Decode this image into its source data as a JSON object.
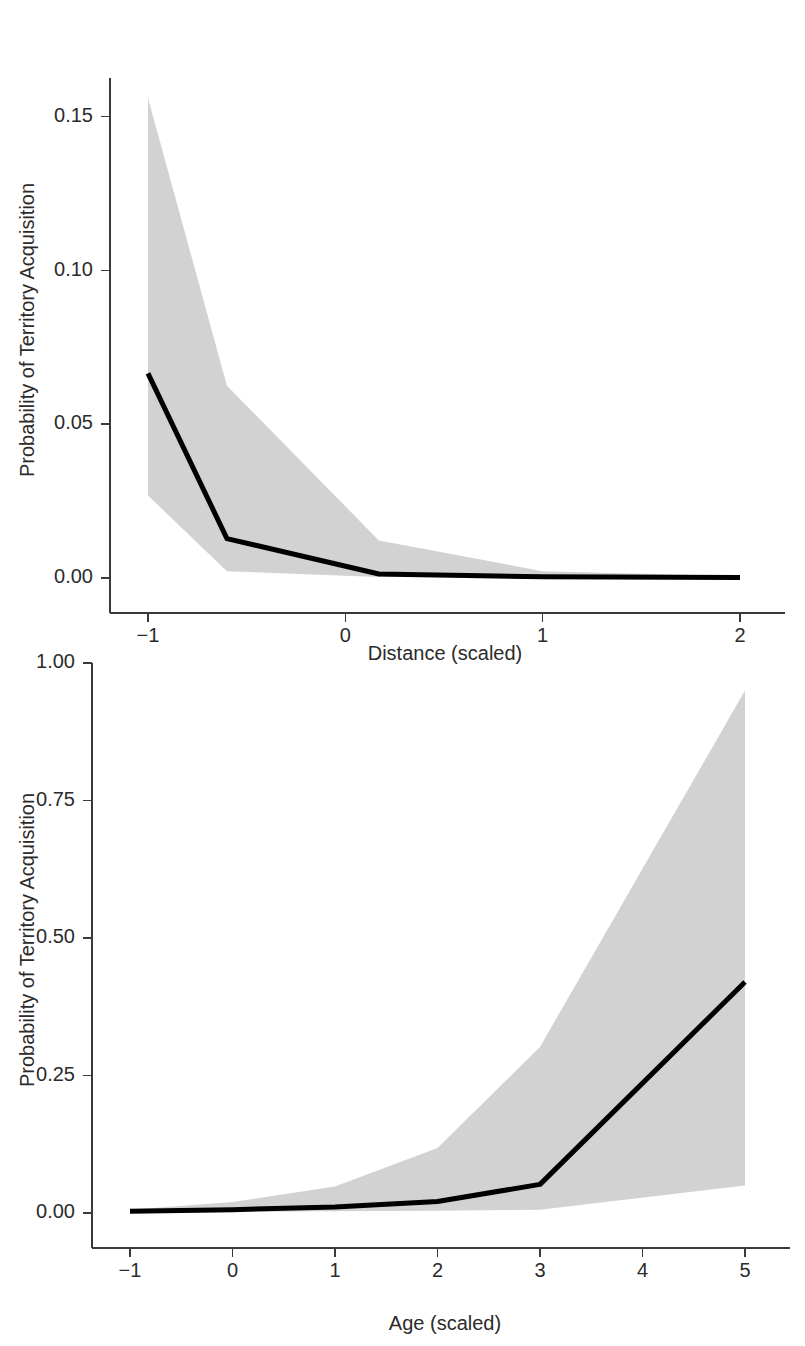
{
  "figure": {
    "background_color": "#ffffff",
    "line_color": "#000000",
    "ribbon_color": "#d2d2d2",
    "axis_color": "#3a3a3a",
    "text_color": "#2b2b2b"
  },
  "chart_data": [
    {
      "id": "distance-panel",
      "type": "line",
      "title": "",
      "xlabel": "Distance (scaled)",
      "ylabel": "Probability of Territory Acquisition",
      "xlim": [
        -1,
        2
      ],
      "ylim": [
        0.0,
        0.1625
      ],
      "xticks": [
        -1,
        0,
        1,
        2
      ],
      "xticklabels": [
        "−1",
        "0",
        "1",
        "2"
      ],
      "yticks": [
        0.0,
        0.05,
        0.1,
        0.15
      ],
      "yticklabels": [
        "0.00",
        "0.05",
        "0.10",
        "0.15"
      ],
      "grid": false,
      "legend": "none",
      "series": [
        {
          "name": "Predicted probability",
          "x": [
            -1.0,
            -0.6,
            0.17,
            1.0,
            2.0
          ],
          "values": [
            0.0665,
            0.0128,
            0.0013,
            0.0004,
            0.0002
          ]
        }
      ],
      "ribbon": {
        "name": "95% confidence interval",
        "x": [
          -1.0,
          -0.6,
          0.17,
          1.0,
          2.0
        ],
        "upper": [
          0.156,
          0.0625,
          0.0122,
          0.0022,
          0.0006
        ],
        "lower": [
          0.0268,
          0.0022,
          0.0003,
          0.0001,
          0.0
        ]
      }
    },
    {
      "id": "age-panel",
      "type": "line",
      "title": "",
      "xlabel": "Age (scaled)",
      "ylabel": "Probability of Territory Acquisition",
      "xlim": [
        -1,
        5
      ],
      "ylim": [
        0.0,
        1.0
      ],
      "xticks": [
        -1,
        0,
        1,
        2,
        3,
        4,
        5
      ],
      "xticklabels": [
        "−1",
        "0",
        "1",
        "2",
        "3",
        "4",
        "5"
      ],
      "yticks": [
        0.0,
        0.25,
        0.5,
        0.75,
        1.0
      ],
      "yticklabels": [
        "0.00",
        "0.25",
        "0.50",
        "0.75",
        "1.00"
      ],
      "grid": false,
      "legend": "none",
      "series": [
        {
          "name": "Predicted probability",
          "x": [
            -1,
            0,
            1,
            2,
            3,
            5
          ],
          "values": [
            0.003,
            0.006,
            0.011,
            0.021,
            0.052,
            0.42
          ]
        }
      ],
      "ribbon": {
        "name": "95% confidence interval",
        "x": [
          -1,
          0,
          1,
          2,
          3,
          5
        ],
        "upper": [
          0.006,
          0.02,
          0.048,
          0.118,
          0.302,
          0.95
        ],
        "lower": [
          0.001,
          0.002,
          0.003,
          0.004,
          0.006,
          0.05
        ]
      }
    }
  ]
}
